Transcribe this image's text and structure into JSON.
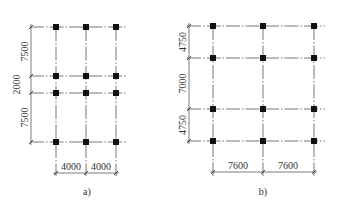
{
  "diagrams": [
    {
      "id": "a",
      "caption": "a)",
      "columns_x_spacing": [
        "4000",
        "4000"
      ],
      "rows_y_spacing": [
        "7500",
        "2000",
        "7500"
      ],
      "grid_columns": 3,
      "grid_rows": 4
    },
    {
      "id": "b",
      "caption": "b)",
      "columns_x_spacing": [
        "7600",
        "7600"
      ],
      "rows_y_spacing": [
        "4750",
        "7000",
        "4750"
      ],
      "grid_columns": 3,
      "grid_rows": 4
    }
  ],
  "colors": {
    "column": "#111111",
    "grid_line": "#555555",
    "dimension_line": "#444444",
    "background": "#ffffff"
  }
}
